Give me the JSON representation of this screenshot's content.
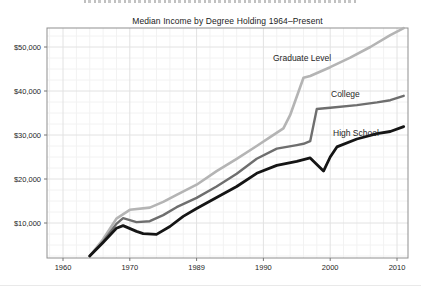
{
  "chart_data": {
    "type": "line",
    "title": "Median Income by Degree Holding 1964–Present",
    "xlabel": "",
    "ylabel": "",
    "x_tick_labels": [
      "1960",
      "1970",
      "1989",
      "1990",
      "2000",
      "2010"
    ],
    "x_tick_years": [
      1960,
      1970,
      1980,
      1990,
      2000,
      2010
    ],
    "y_tick_labels": [
      "$10,000",
      "$20,000",
      "$30,000",
      "$40,000",
      "$50,000"
    ],
    "y_tick_values": [
      10000,
      20000,
      30000,
      40000,
      50000
    ],
    "x_range_years": [
      1957.6,
      2014.6
    ],
    "y_range_dollars": [
      2000,
      54500
    ],
    "grid": {
      "shown": true,
      "minor_x_step_years": 2,
      "minor_y_step_dollars": 2500
    },
    "legend_position": "labels-on-lines",
    "colors": {
      "graduate": "#b4b4b4",
      "college": "#6e6e6e",
      "high_school": "#151515",
      "frame": "#8f8f8f",
      "major_grid": "#e2e2e2",
      "minor_grid": "#f2f2f2"
    },
    "series": [
      {
        "name": "Graduate Level",
        "color": "#b4b4b4",
        "stroke_width": 2.6,
        "points": [
          [
            1964,
            2500
          ],
          [
            1966,
            6300
          ],
          [
            1968,
            11000
          ],
          [
            1970,
            13000
          ],
          [
            1973,
            13500
          ],
          [
            1975,
            14800
          ],
          [
            1977,
            16400
          ],
          [
            1980,
            18700
          ],
          [
            1983,
            21800
          ],
          [
            1986,
            24600
          ],
          [
            1989,
            27500
          ],
          [
            1991,
            29500
          ],
          [
            1993,
            31500
          ],
          [
            1994,
            34500
          ],
          [
            1996,
            43000
          ],
          [
            1997,
            43400
          ],
          [
            2000,
            45400
          ],
          [
            2003,
            47600
          ],
          [
            2006,
            50000
          ],
          [
            2009,
            52700
          ],
          [
            2011,
            54300
          ]
        ]
      },
      {
        "name": "College",
        "color": "#6e6e6e",
        "stroke_width": 2.4,
        "points": [
          [
            1964,
            2500
          ],
          [
            1966,
            5800
          ],
          [
            1968,
            9800
          ],
          [
            1969,
            11100
          ],
          [
            1971,
            10200
          ],
          [
            1973,
            10400
          ],
          [
            1975,
            11800
          ],
          [
            1977,
            13600
          ],
          [
            1980,
            15700
          ],
          [
            1983,
            18300
          ],
          [
            1986,
            21200
          ],
          [
            1989,
            24600
          ],
          [
            1992,
            26900
          ],
          [
            1995,
            27700
          ],
          [
            1996,
            28000
          ],
          [
            1997,
            28600
          ],
          [
            1998,
            35900
          ],
          [
            2000,
            36200
          ],
          [
            2004,
            36800
          ],
          [
            2007,
            37400
          ],
          [
            2009,
            37900
          ],
          [
            2011,
            38900
          ]
        ]
      },
      {
        "name": "High School",
        "color": "#151515",
        "stroke_width": 2.8,
        "points": [
          [
            1964,
            2500
          ],
          [
            1966,
            5600
          ],
          [
            1968,
            8800
          ],
          [
            1969,
            9400
          ],
          [
            1971,
            8100
          ],
          [
            1972,
            7600
          ],
          [
            1974,
            7400
          ],
          [
            1976,
            9200
          ],
          [
            1978,
            11500
          ],
          [
            1980,
            13300
          ],
          [
            1983,
            15800
          ],
          [
            1986,
            18300
          ],
          [
            1989,
            21300
          ],
          [
            1992,
            23100
          ],
          [
            1995,
            24000
          ],
          [
            1997,
            24800
          ],
          [
            1999,
            21800
          ],
          [
            2000,
            25000
          ],
          [
            2001,
            27300
          ],
          [
            2004,
            29100
          ],
          [
            2007,
            30300
          ],
          [
            2009,
            30800
          ],
          [
            2011,
            31900
          ]
        ]
      }
    ]
  }
}
